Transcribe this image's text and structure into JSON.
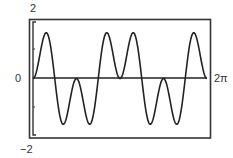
{
  "chart_data": {
    "type": "line",
    "title": "",
    "xlabel": "",
    "ylabel": "",
    "function": "y = 2 sin(2x) sin(4x)",
    "xlim": [
      0,
      6.2832
    ],
    "ylim": [
      -2,
      2
    ],
    "grid": false,
    "legend": null,
    "x_tick_labels": {
      "min": "0",
      "max": "2π"
    },
    "y_tick_labels": {
      "max": "2",
      "min": "-2"
    },
    "y_minor_ticks": [
      -1,
      1
    ],
    "key_points": {
      "x": [
        0,
        0.48,
        0.785,
        1.09,
        1.571,
        2.05,
        2.356,
        2.66,
        3.1416,
        3.62,
        3.927,
        4.23,
        4.712,
        5.19,
        5.498,
        5.8,
        6.2832
      ],
      "y": [
        0,
        1.54,
        0,
        -1.54,
        0,
        -1.54,
        0,
        1.54,
        0,
        1.54,
        0,
        -1.54,
        0,
        -1.54,
        0,
        1.54,
        0
      ]
    },
    "samples": 400
  },
  "labels": {
    "ymax": "2",
    "ymin": "−2",
    "xmin": "0",
    "xmax": "2π"
  },
  "style": {
    "line_color": "#222222",
    "frame_color": "#333333",
    "background": "#ffffff"
  }
}
